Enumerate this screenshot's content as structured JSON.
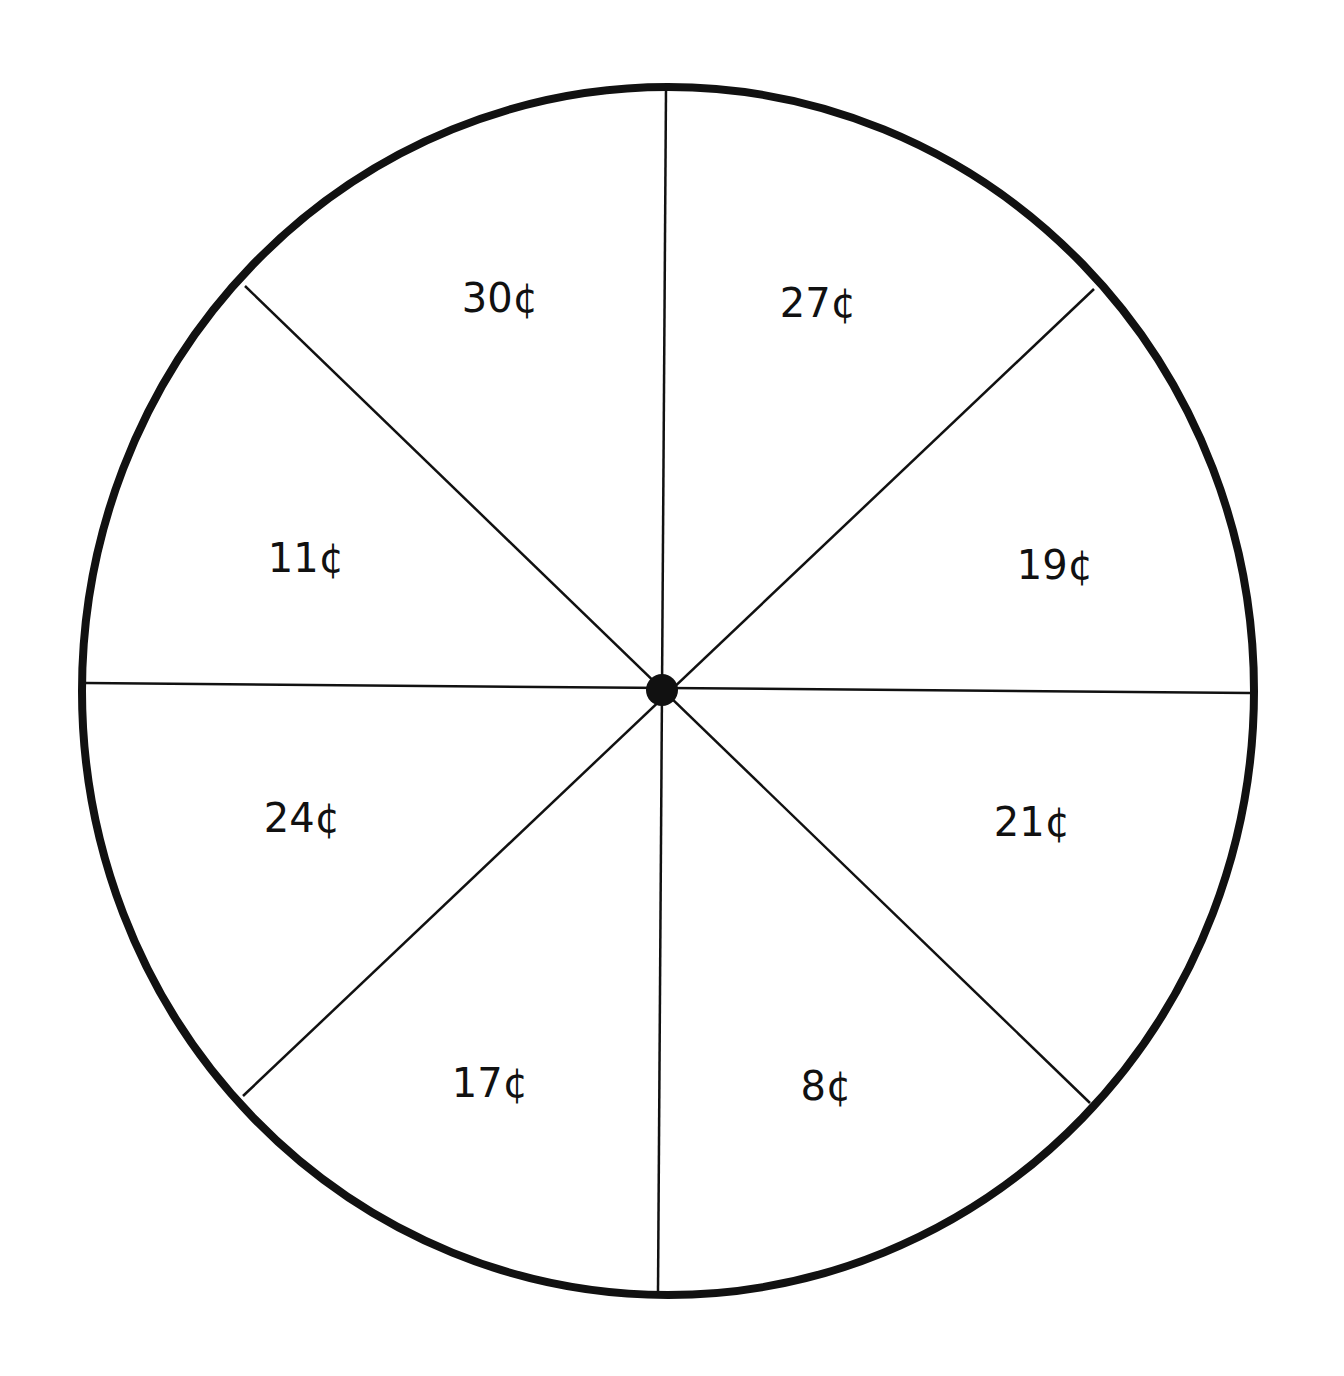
{
  "spinner": {
    "center": [
      662,
      690
    ],
    "radius": 586,
    "rim_color": "#111111",
    "divider_color": "#111111",
    "sections": [
      {
        "label": "30¢",
        "pos": [
          500,
          298
        ]
      },
      {
        "label": "27¢",
        "pos": [
          818,
          303
        ]
      },
      {
        "label": "19¢",
        "pos": [
          1055,
          565
        ]
      },
      {
        "label": "21¢",
        "pos": [
          1032,
          822
        ]
      },
      {
        "label": "8¢",
        "pos": [
          826,
          1086
        ]
      },
      {
        "label": "17¢",
        "pos": [
          490,
          1083
        ]
      },
      {
        "label": "24¢",
        "pos": [
          302,
          818
        ]
      },
      {
        "label": "11¢",
        "pos": [
          306,
          558
        ]
      }
    ]
  }
}
